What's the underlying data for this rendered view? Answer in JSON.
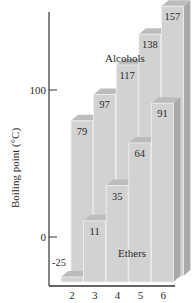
{
  "chart_data": {
    "type": "bar",
    "title": "",
    "xlabel": "",
    "ylabel": "Boiling point (°C)",
    "categories": [
      "2",
      "3",
      "4",
      "5",
      "6"
    ],
    "series": [
      {
        "name": "Alcohols",
        "values": [
          79,
          97,
          117,
          138,
          157
        ]
      },
      {
        "name": "Ethers",
        "values": [
          -25,
          11,
          35,
          64,
          91
        ]
      }
    ],
    "yticks": [
      "100",
      "0"
    ],
    "ylim": [
      -40,
      165
    ],
    "grid": false,
    "legend_position": "inline annotations",
    "annotations": [
      "Alcohols",
      "Ethers"
    ]
  },
  "labels": {
    "ylabel": "Boiling point (°C)",
    "ytick_100": "100",
    "ytick_0": "0",
    "alcohols": "Alcohols",
    "ethers": "Ethers"
  },
  "colors": {
    "front": "#d2d2d2",
    "top": "#bcbcbc",
    "side": "#a9a9a9",
    "edge": "#f2f2f2",
    "axis": "#333333"
  }
}
